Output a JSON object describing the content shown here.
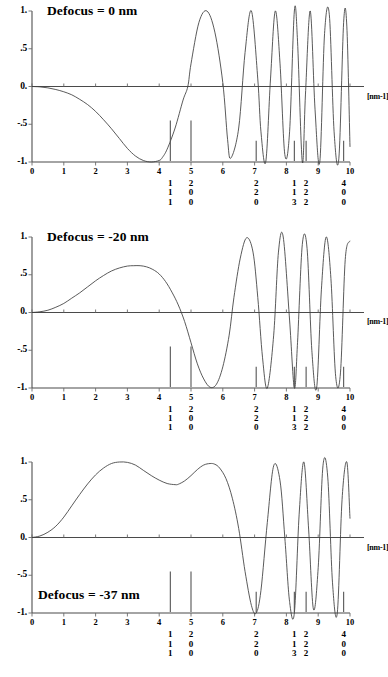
{
  "figure": {
    "unit_label": "[nm-1]",
    "y_ticks": [
      "1.",
      ".5",
      "0.",
      "-.5",
      "-1."
    ],
    "x_ticks": [
      "0",
      "1",
      "2",
      "3",
      "4",
      "5",
      "6",
      "7",
      "8",
      "9",
      "10"
    ],
    "curve_color": "#3c3c3c",
    "axis_color": "#5a5a5a"
  },
  "miller_markers": [
    {
      "x": 4.35,
      "indices": [
        "1",
        "1",
        "1"
      ]
    },
    {
      "x": 5.0,
      "indices": [
        "2",
        "0",
        "0"
      ]
    },
    {
      "x": 7.05,
      "indices": [
        "2",
        "2",
        "0"
      ]
    },
    {
      "x": 8.25,
      "indices": [
        "1",
        "1",
        "3"
      ]
    },
    {
      "x": 8.62,
      "indices": [
        "2",
        "2",
        "2"
      ]
    },
    {
      "x": 9.8,
      "indices": [
        "4",
        "0",
        "0"
      ]
    }
  ],
  "panels": [
    {
      "title": "Defocus = 0 nm",
      "title_position": "top",
      "chart_data": {
        "type": "line",
        "title": "Defocus = 0 nm",
        "xlabel": "[nm-1]",
        "ylabel": "",
        "xlim": [
          0,
          10
        ],
        "ylim": [
          -1,
          1
        ],
        "grid": false,
        "legend": "none",
        "defocus_nm": 0,
        "x": [
          0,
          0.25,
          0.5,
          0.75,
          1.0,
          1.25,
          1.5,
          1.75,
          2.0,
          2.25,
          2.5,
          2.75,
          3.0,
          3.25,
          3.5,
          3.75,
          4.0,
          4.1,
          4.25,
          4.5,
          4.75,
          4.9,
          5.0,
          5.25,
          5.5,
          5.75,
          6.0,
          6.15,
          6.25,
          6.5,
          6.7,
          6.9,
          7.1,
          7.2,
          7.35,
          7.5,
          7.65,
          7.8,
          7.95,
          8.1,
          8.25,
          8.35,
          8.5,
          8.6,
          8.75,
          8.9,
          9.05,
          9.2,
          9.35,
          9.5,
          9.65,
          9.8,
          9.9,
          10.0
        ],
        "y": [
          0,
          -0.005,
          -0.018,
          -0.04,
          -0.07,
          -0.11,
          -0.17,
          -0.24,
          -0.33,
          -0.44,
          -0.56,
          -0.69,
          -0.82,
          -0.92,
          -0.98,
          -1.0,
          -0.98,
          -0.94,
          -0.83,
          -0.55,
          -0.18,
          0.0,
          0.3,
          0.85,
          1.0,
          0.72,
          0.05,
          -0.7,
          -0.95,
          -0.55,
          0.45,
          1.0,
          0.1,
          -0.6,
          -1.0,
          0.1,
          1.0,
          0.3,
          -0.9,
          -0.6,
          1.0,
          0.6,
          -1.0,
          -0.1,
          1.0,
          -0.3,
          -1.0,
          0.7,
          0.95,
          -0.6,
          -0.95,
          0.85,
          0.8,
          -0.8
        ]
      }
    },
    {
      "title": "Defocus = -20 nm",
      "title_position": "top",
      "chart_data": {
        "type": "line",
        "title": "Defocus = -20 nm",
        "xlabel": "[nm-1]",
        "ylabel": "",
        "xlim": [
          0,
          10
        ],
        "ylim": [
          -1,
          1
        ],
        "grid": false,
        "legend": "none",
        "defocus_nm": -20,
        "x": [
          0,
          0.25,
          0.5,
          0.75,
          1.0,
          1.25,
          1.5,
          1.75,
          2.0,
          2.25,
          2.5,
          2.75,
          3.0,
          3.2,
          3.4,
          3.6,
          3.8,
          4.0,
          4.2,
          4.4,
          4.6,
          4.8,
          5.0,
          5.2,
          5.4,
          5.6,
          5.8,
          6.0,
          6.2,
          6.35,
          6.55,
          6.75,
          6.95,
          7.1,
          7.25,
          7.4,
          7.6,
          7.75,
          7.9,
          8.1,
          8.25,
          8.35,
          8.5,
          8.65,
          8.8,
          8.95,
          9.1,
          9.25,
          9.4,
          9.55,
          9.7,
          9.85,
          10.0
        ],
        "y": [
          0,
          0.01,
          0.03,
          0.07,
          0.12,
          0.19,
          0.26,
          0.34,
          0.42,
          0.49,
          0.55,
          0.59,
          0.615,
          0.62,
          0.62,
          0.605,
          0.57,
          0.51,
          0.41,
          0.27,
          0.1,
          -0.12,
          -0.4,
          -0.68,
          -0.88,
          -0.99,
          -0.95,
          -0.72,
          -0.3,
          0.2,
          0.72,
          0.99,
          0.8,
          0.2,
          -0.6,
          -1.0,
          -0.3,
          0.8,
          1.0,
          -0.1,
          -1.0,
          -0.4,
          0.9,
          0.85,
          -0.5,
          -1.0,
          0.3,
          1.0,
          0.45,
          -0.85,
          -0.8,
          0.7,
          0.95
        ]
      }
    },
    {
      "title": "Defocus = -37 nm",
      "title_position": "bottom",
      "chart_data": {
        "type": "line",
        "title": "Defocus = -37 nm",
        "xlabel": "[nm-1]",
        "ylabel": "",
        "xlim": [
          0,
          10
        ],
        "ylim": [
          -1,
          1
        ],
        "grid": false,
        "legend": "none",
        "defocus_nm": -37,
        "x": [
          0,
          0.25,
          0.5,
          0.75,
          1.0,
          1.25,
          1.5,
          1.75,
          2.0,
          2.25,
          2.5,
          2.75,
          3.0,
          3.25,
          3.5,
          3.75,
          4.0,
          4.25,
          4.5,
          4.6,
          4.8,
          5.0,
          5.2,
          5.4,
          5.6,
          5.75,
          5.9,
          6.1,
          6.3,
          6.5,
          6.7,
          6.9,
          7.05,
          7.2,
          7.4,
          7.6,
          7.8,
          7.95,
          8.1,
          8.25,
          8.4,
          8.55,
          8.7,
          8.85,
          9.0,
          9.15,
          9.3,
          9.45,
          9.6,
          9.75,
          9.9,
          10.0
        ],
        "y": [
          0,
          0.02,
          0.07,
          0.15,
          0.27,
          0.42,
          0.57,
          0.71,
          0.83,
          0.92,
          0.98,
          1.0,
          0.995,
          0.96,
          0.89,
          0.82,
          0.76,
          0.715,
          0.7,
          0.705,
          0.75,
          0.82,
          0.9,
          0.96,
          0.98,
          0.97,
          0.92,
          0.78,
          0.52,
          0.12,
          -0.45,
          -0.9,
          -1.0,
          -0.7,
          0.2,
          0.95,
          0.75,
          0.0,
          -0.85,
          -1.0,
          0.3,
          1.0,
          0.1,
          -0.95,
          -0.4,
          0.95,
          0.8,
          -0.6,
          -1.0,
          0.5,
          1.0,
          0.25
        ]
      }
    }
  ]
}
